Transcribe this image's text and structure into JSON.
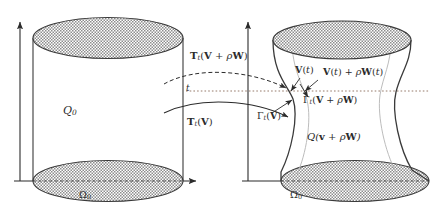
{
  "figure": {
    "kind": "mathematical-diagram",
    "background_color": "#ffffff",
    "ink_color": "#2b2b2b",
    "hatch_color": "#9a9a9a"
  },
  "left_shape": {
    "name": "reference-cylinder",
    "body_label": "Q",
    "body_label_sub": "0",
    "base_label": "Ω",
    "base_label_sub": "0",
    "axis_vertical": "t-axis",
    "axis_horizontal": "x-axis"
  },
  "right_shape": {
    "name": "perturbed-tube",
    "body_label_q": "Q(",
    "body_label_v": "v",
    "body_label_plus": " + ",
    "body_label_rho": "ρ",
    "body_label_w": "W",
    "body_label_close": ")",
    "base_label": "Ω",
    "base_label_sub": "0",
    "axis_vertical": "t-axis",
    "axis_horizontal": "x-axis"
  },
  "maps": {
    "upper": {
      "name": "T_t(V + rho W)",
      "T": "T",
      "T_sub": "t",
      "open": "(",
      "V": "V",
      "plus": " + ",
      "rho": "ρ",
      "W": "W",
      "close": ")",
      "style": "dashed-arrow"
    },
    "lower": {
      "name": "T_t(V)",
      "T": "T",
      "T_sub": "t",
      "open": "(",
      "V": "V",
      "close": ")",
      "style": "solid-arrow"
    },
    "time_label": "t"
  },
  "annotations": {
    "v_of_t": {
      "V": "V",
      "paren": "(",
      "t": "t",
      "close": ")"
    },
    "v_plus_rho_w": {
      "V": "V",
      "open": "(",
      "t": "t",
      "close": ")",
      "plus": " + ",
      "rho": "ρ",
      "W": "W",
      "open2": "(",
      "t2": "t",
      "close2": ")"
    },
    "gamma_v": {
      "gamma": "Γ",
      "sub": "t",
      "open": "(",
      "V": "V",
      "close": ")"
    },
    "gamma_v_plus_rho_w": {
      "gamma": "Γ",
      "sub": "t",
      "open": "(",
      "V": "V",
      "plus": " + ",
      "rho": "ρ",
      "W": "W",
      "close": ")"
    }
  },
  "guides": {
    "horizontal_dotted_line": "level line at parameter t"
  }
}
